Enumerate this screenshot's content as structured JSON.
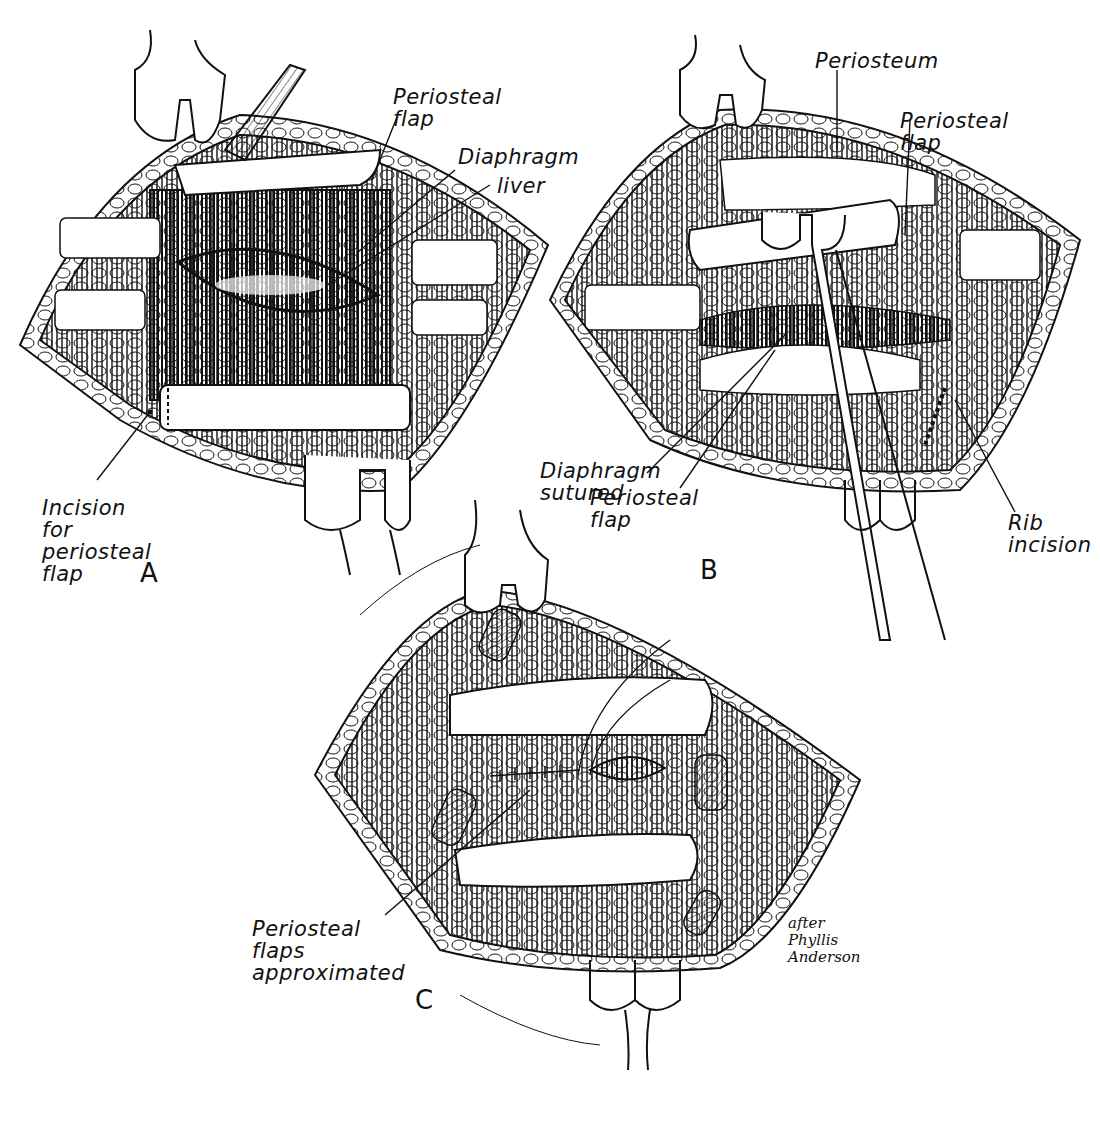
{
  "figure": {
    "panels": [
      {
        "letter": "A",
        "labels": {
          "periosteal_flap": "Periosteal\nflap",
          "diaphragm": "Diaphragm",
          "liver": "liver",
          "incision": "Incision for\nperiosteal\nflap"
        }
      },
      {
        "letter": "B",
        "labels": {
          "periosteum": "Periosteum",
          "periosteal_flap_top": "Periosteal\nflap",
          "diaphragm_sutured": "Diaphragm\nsutured",
          "periosteal_flap_bottom": "Periosteal\nflap",
          "rib_incision": "Rib\nincision"
        }
      },
      {
        "letter": "C",
        "labels": {
          "flaps_approximated": "Periosteal\nflaps\napproximated"
        }
      }
    ],
    "credit": "after\nPhyllis\nAnderson"
  }
}
